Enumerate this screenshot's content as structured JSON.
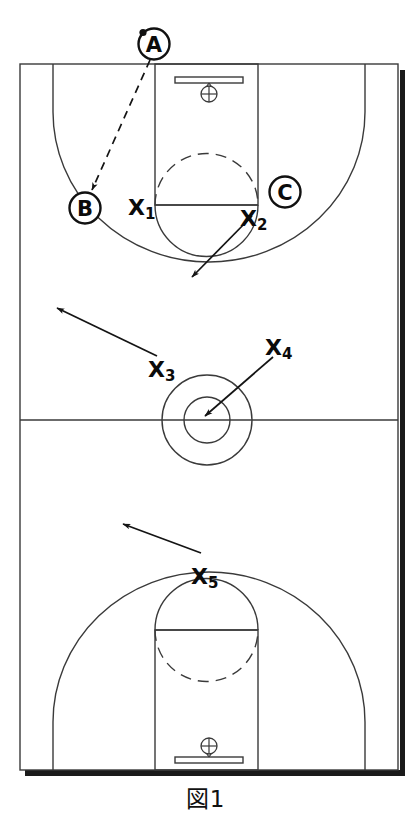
{
  "figure": {
    "caption": "図1",
    "colors": {
      "line": "#3a3a3a",
      "ink": "#0b0b0b",
      "shadow": "#1a1a1a",
      "background": "#ffffff"
    }
  },
  "court": {
    "left": 20,
    "top": 64,
    "right": 398,
    "bottom": 770,
    "halfcourt_y": 420,
    "lane_left": 155,
    "lane_right": 258,
    "top_freethrow_y": 205,
    "bottom_freethrow_y": 630,
    "center_circle": {
      "cx": 207,
      "cy": 420,
      "r_outer": 45,
      "r_inner": 23
    }
  },
  "baskets": [
    {
      "name": "top-basket",
      "backboard_y": 80,
      "hoop_cy": 93
    },
    {
      "name": "bottom-basket",
      "backboard_y": 760,
      "hoop_cy": 745
    }
  ],
  "offense": [
    {
      "id": "A",
      "label": "A",
      "cx": 154,
      "cy": 44,
      "has_ball": true
    },
    {
      "id": "B",
      "label": "B",
      "cx": 85,
      "cy": 208,
      "has_ball": false
    },
    {
      "id": "C",
      "label": "C",
      "cx": 285,
      "cy": 192,
      "has_ball": false
    }
  ],
  "defense": [
    {
      "id": "X1",
      "label": "X",
      "sub": "1",
      "x": 128,
      "y": 215
    },
    {
      "id": "X2",
      "label": "X",
      "sub": "2",
      "x": 240,
      "y": 226
    },
    {
      "id": "X3",
      "label": "X",
      "sub": "3",
      "x": 148,
      "y": 377
    },
    {
      "id": "X4",
      "label": "X",
      "sub": "4",
      "x": 265,
      "y": 355
    },
    {
      "id": "X5",
      "label": "X",
      "sub": "5",
      "x": 191,
      "y": 584
    }
  ],
  "movements": [
    {
      "id": "pass-a-to-b",
      "kind": "pass",
      "style": "dashed",
      "from": [
        150,
        60
      ],
      "to": [
        92,
        190
      ]
    },
    {
      "id": "x2-cut",
      "kind": "move",
      "style": "solid",
      "from": [
        252,
        216
      ],
      "to": [
        192,
        277
      ]
    },
    {
      "id": "x3-move",
      "kind": "move",
      "style": "solid",
      "from": [
        157,
        356
      ],
      "to": [
        57,
        308
      ]
    },
    {
      "id": "x4-move",
      "kind": "move",
      "style": "solid",
      "from": [
        273,
        357
      ],
      "to": [
        205,
        416
      ]
    },
    {
      "id": "x5-move",
      "kind": "move",
      "style": "solid",
      "from": [
        201,
        553
      ],
      "to": [
        123,
        524
      ]
    }
  ]
}
